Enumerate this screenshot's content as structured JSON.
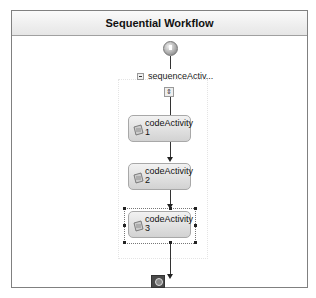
{
  "workflow": {
    "title": "Sequential Workflow"
  },
  "sequence": {
    "name": "sequenceActiv..."
  },
  "activities": [
    {
      "line1": "codeActivity",
      "line2": "1",
      "selected": false
    },
    {
      "line1": "codeActivity",
      "line2": "2",
      "selected": false
    },
    {
      "line1": "codeActivity",
      "line2": "3",
      "selected": true
    }
  ],
  "icons": {
    "start": "workflow-start-icon",
    "end": "workflow-end-icon",
    "collapse": "collapse-icon",
    "expand": "expand-icon",
    "activity": "code-activity-icon"
  }
}
